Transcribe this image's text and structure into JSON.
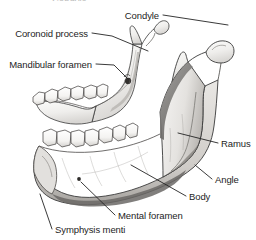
{
  "figure": {
    "width": 256,
    "height": 240,
    "background_color": "#ffffff",
    "ink_color": "#242424",
    "bone_fill": "#f2f1ef",
    "shadow_color": "#8d8d8d"
  },
  "partial_top_text": "Condyle",
  "labels": [
    {
      "id": "condyle",
      "text": "Condyle",
      "align": "right",
      "text_x": 159,
      "text_y": 11,
      "leader": "M 163 15 L 228 25"
    },
    {
      "id": "coronoid-process",
      "text": "Coronoid process",
      "align": "right",
      "text_x": 88,
      "text_y": 29,
      "leader": "M 92 33 L 112 36 L 148 51"
    },
    {
      "id": "mandibular-foramen",
      "text": "Mandibular foramen",
      "align": "right",
      "text_x": 92,
      "text_y": 60,
      "leader": "M 96 64 L 114 65 L 128 79"
    },
    {
      "id": "ramus",
      "text": "Ramus",
      "align": "left",
      "text_x": 221,
      "text_y": 139,
      "leader": "M 218 143 L 178 133"
    },
    {
      "id": "angle",
      "text": "Angle",
      "align": "left",
      "text_x": 215,
      "text_y": 175,
      "leader": "M 212 179 L 195 165"
    },
    {
      "id": "body",
      "text": "Body",
      "align": "left",
      "text_x": 189,
      "text_y": 192,
      "leader": "M 186 196 L 131 165"
    },
    {
      "id": "mental-foramen",
      "text": "Mental foramen",
      "align": "left",
      "text_x": 118,
      "text_y": 211,
      "leader": "M 115 215 L 81 182"
    },
    {
      "id": "symphysis-menti",
      "text": "Symphysis menti",
      "align": "left",
      "text_x": 55,
      "text_y": 225,
      "leader": "M 52 229 L 40 194"
    }
  ]
}
